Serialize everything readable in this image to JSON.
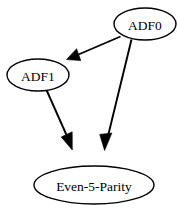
{
  "diagram": {
    "type": "directed-graph",
    "background_color": "#ffffff",
    "node_fill_color": "#ffffff",
    "node_stroke_color": "#000000",
    "edge_color": "#000000",
    "nodes": [
      {
        "id": "adf0",
        "label": "ADF0",
        "shape": "ellipse",
        "cx": 145,
        "cy": 24,
        "rx": 31,
        "ry": 16
      },
      {
        "id": "adf1",
        "label": "ADF1",
        "shape": "ellipse",
        "cx": 38,
        "cy": 75,
        "rx": 31,
        "ry": 16
      },
      {
        "id": "even5parity",
        "label": "Even-5-Parity",
        "shape": "ellipse",
        "cx": 94,
        "cy": 185,
        "rx": 60,
        "ry": 19
      }
    ],
    "edges": [
      {
        "id": "edge-adf0-adf1",
        "from": "ADF0",
        "to": "ADF1",
        "arrow": "filled-triangle"
      },
      {
        "id": "edge-adf1-even5parity",
        "from": "ADF1",
        "to": "Even-5-Parity",
        "arrow": "filled-triangle"
      },
      {
        "id": "edge-adf0-even5parity",
        "from": "ADF0",
        "to": "Even-5-Parity",
        "arrow": "filled-triangle"
      }
    ]
  }
}
